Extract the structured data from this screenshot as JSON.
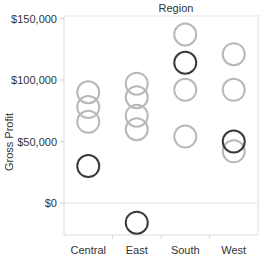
{
  "chart_data": {
    "type": "scatter",
    "title": "Region",
    "xlabel": "",
    "ylabel": "Gross Profit",
    "categories": [
      "Central",
      "East",
      "South",
      "West"
    ],
    "ylim": [
      -30000,
      155000
    ],
    "yticks": [
      {
        "value": 150000,
        "label": "$150,000"
      },
      {
        "value": 100000,
        "label": "$100,000"
      },
      {
        "value": 50000,
        "label": "$50,000"
      },
      {
        "value": 0,
        "label": "$0"
      }
    ],
    "grid": {
      "horizontal": "zero-line-only",
      "vertical": "category-separators"
    },
    "colors": {
      "light": "#b8b8b8",
      "dark": "#3a3a3a"
    },
    "points": [
      {
        "category": "Central",
        "value": 90000,
        "shade": "light"
      },
      {
        "category": "Central",
        "value": 78000,
        "shade": "light"
      },
      {
        "category": "Central",
        "value": 66000,
        "shade": "light"
      },
      {
        "category": "Central",
        "value": 30000,
        "shade": "dark"
      },
      {
        "category": "East",
        "value": 97000,
        "shade": "light"
      },
      {
        "category": "East",
        "value": 86000,
        "shade": "light"
      },
      {
        "category": "East",
        "value": 71000,
        "shade": "light"
      },
      {
        "category": "East",
        "value": 60000,
        "shade": "light"
      },
      {
        "category": "East",
        "value": -16000,
        "shade": "dark"
      },
      {
        "category": "South",
        "value": 137000,
        "shade": "light"
      },
      {
        "category": "South",
        "value": 114000,
        "shade": "dark"
      },
      {
        "category": "South",
        "value": 92000,
        "shade": "light"
      },
      {
        "category": "South",
        "value": 54000,
        "shade": "light"
      },
      {
        "category": "West",
        "value": 121000,
        "shade": "light"
      },
      {
        "category": "West",
        "value": 92000,
        "shade": "light"
      },
      {
        "category": "West",
        "value": 50000,
        "shade": "dark"
      },
      {
        "category": "West",
        "value": 42000,
        "shade": "light"
      }
    ]
  }
}
